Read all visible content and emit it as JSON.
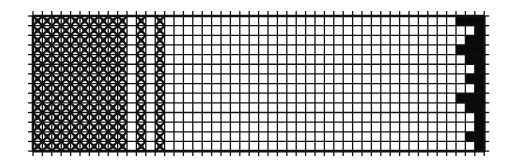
{
  "diagram": {
    "type": "weaving-draft-grid",
    "grid": {
      "columns": 48,
      "rows": 14,
      "origin_x": 33,
      "origin_y": 16,
      "cell_width": 9.4,
      "cell_height": 9.65,
      "line_color": "#111111",
      "tick_length": 5
    },
    "crosshatch_block": {
      "col_start": 0,
      "col_end": 10
    },
    "cross_columns": [
      11,
      13
    ],
    "right_fill": {
      "color": "#0a0a0a",
      "cells_from_right_per_row": [
        3,
        1,
        2,
        3,
        2,
        1,
        2,
        1,
        3,
        2,
        1,
        1,
        2,
        1
      ]
    },
    "colors": {
      "background": "#ffffff",
      "ink": "#111111"
    }
  }
}
